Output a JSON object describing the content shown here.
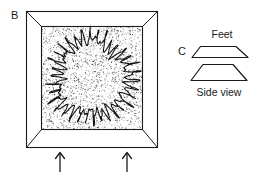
{
  "figure": {
    "background_color": "#ffffff",
    "ink_color": "#1a1a1a",
    "width": 265,
    "height": 175
  },
  "panel_b": {
    "label": "B",
    "label_x": 11,
    "label_y": 19,
    "container": {
      "name": "sand-tray",
      "outer": {
        "x": 26,
        "y": 11,
        "width": 132,
        "height": 137
      },
      "inner": {
        "x": 41,
        "y": 26,
        "width": 102,
        "height": 104
      },
      "frame_fill": "#ffffff",
      "sand_fill": "#ffffff",
      "stipple_color": "#2a2a2a",
      "stipple_count": 2600
    },
    "track": {
      "name": "meandering-circular-track",
      "description": "closed looping squiggle forming a ring inside the tray",
      "center_x": 92,
      "center_y": 78,
      "radius_x": 38,
      "radius_y": 40,
      "loop_count": 34,
      "loop_amplitude": 6.5,
      "stroke_color": "#121212"
    },
    "arrows": [
      {
        "name": "arrow-left",
        "x": 60,
        "y_top": 152,
        "y_bottom": 172
      },
      {
        "name": "arrow-right",
        "x": 127,
        "y_top": 152,
        "y_bottom": 172
      }
    ]
  },
  "panel_c": {
    "label": "C",
    "label_x": 178,
    "label_y": 55,
    "captions": {
      "top": "Feet",
      "bottom": "Side view"
    },
    "top_caption_pos": {
      "x": 222,
      "y": 38
    },
    "bottom_caption_pos": {
      "x": 222,
      "y": 96
    },
    "shapes": [
      {
        "name": "foot-shape-top",
        "description": "wide flat trapezoid with base lip",
        "points": "192,57 200,47 236,47 248,57"
      },
      {
        "name": "foot-shape-bottom",
        "description": "taller trapezoid side view",
        "points": "191,80 203,64 233,64 247,80"
      }
    ]
  }
}
